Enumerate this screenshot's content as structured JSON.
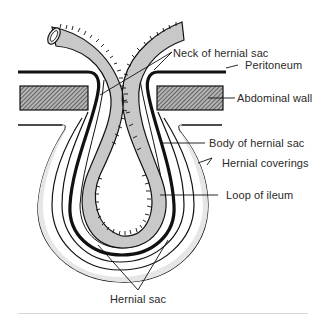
{
  "figure": {
    "type": "anatomical-diagram",
    "labels": {
      "neck": "Neck of hernial sac",
      "peritoneum": "Peritoneum",
      "abdominal_wall": "Abdominal wall",
      "body": "Body of hernial sac",
      "coverings": "Hernial coverings",
      "ileum": "Loop of ileum",
      "sac": "Hernial sac"
    },
    "colors": {
      "bowel_fill": "#c8c8c8",
      "hatch_fill": "#8a8a8a",
      "coverings_shade": "#e6e6e6",
      "outline": "#111111",
      "separator": "#d8d8d8"
    }
  }
}
